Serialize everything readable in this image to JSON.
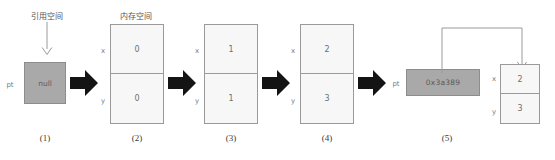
{
  "diagram": {
    "title_ref_space": "引用空间",
    "title_mem_space": "内存空间",
    "pointer_label": "pt",
    "field_x_label": "x",
    "field_y_label": "y",
    "stages": [
      {
        "caption": "(1)",
        "type": "pointer-only",
        "pointer_value": "null"
      },
      {
        "caption": "(2)",
        "type": "memory-block",
        "x_value": "0",
        "y_value": "0"
      },
      {
        "caption": "(3)",
        "type": "memory-block",
        "x_value": "1",
        "y_value": "1"
      },
      {
        "caption": "(4)",
        "type": "memory-block",
        "x_value": "2",
        "y_value": "3"
      },
      {
        "caption": "(5)",
        "type": "pointer-to-memory",
        "pointer_value": "0x3a389",
        "x_value": "2",
        "y_value": "3"
      }
    ],
    "icons": {
      "flow_arrow": "block-right-arrow-icon",
      "down_arrow": "down-arrow-icon",
      "pointer_link": "pointer-link-arrow-icon"
    },
    "colors": {
      "pointer_fill": "#a9a9a9",
      "memory_fill": "#f7f7f7",
      "stroke": "#9a9a9a",
      "arrow_fill": "#141414",
      "text": "#6f6f6f"
    }
  }
}
